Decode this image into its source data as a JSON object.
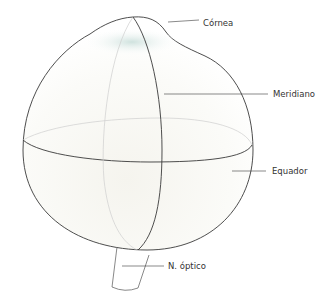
{
  "diagram": {
    "labels": {
      "cornea": "Córnea",
      "meridian": "Meridiano",
      "equator": "Equador",
      "optic_nerve": "N. óptico"
    },
    "colors": {
      "outline": "#3a3a3a",
      "faint_line": "#c9c9c9",
      "fill": "#f7f6f1",
      "cornea_tint": "#d6e6e2",
      "text": "#333333"
    }
  }
}
